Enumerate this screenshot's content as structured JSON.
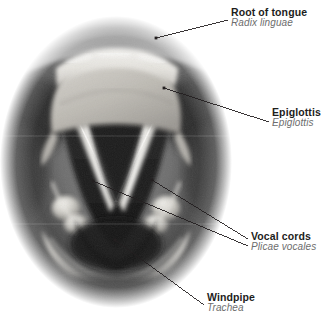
{
  "figure": {
    "image_type": "grayscale anatomical photograph",
    "view": "superior view through laryngoscope",
    "background_color": "#ffffff",
    "label_color": "#1d1d1b",
    "latin_label_color": "#6d6d6d",
    "leader_color": "#231f20"
  },
  "labels": [
    {
      "id": "root-of-tongue",
      "en": "Root of tongue",
      "la": "Radix linguae",
      "label_x": 231,
      "label_y": 7,
      "dot_x": 156,
      "dot_y": 38,
      "elbow_x": 228,
      "elbow_y": 20
    },
    {
      "id": "epiglottis",
      "en": "Epiglottis",
      "la": "Epiglottis",
      "label_x": 272,
      "label_y": 107,
      "dot_x": 164,
      "dot_y": 88,
      "elbow_x": 269,
      "elbow_y": 122
    },
    {
      "id": "vocal-cords",
      "en": "Vocal cords",
      "la": "Plicae vocales",
      "label_x": 251,
      "label_y": 231,
      "dot_x": 93,
      "dot_y": 181,
      "dot2_x": 152,
      "dot2_y": 180,
      "elbow_x": 248,
      "elbow_y": 246,
      "elbow2_x": 248,
      "elbow2_y": 239
    },
    {
      "id": "windpipe",
      "en": "Windpipe",
      "la": "Trachea",
      "label_x": 207,
      "label_y": 292,
      "dot_x": 115,
      "dot_y": 240,
      "elbow_x": 204,
      "elbow_y": 305
    }
  ],
  "anatomy_regions": [
    {
      "id": "epiglottis-body",
      "name": "Epiglottis",
      "tone": "light gray dome"
    },
    {
      "id": "root-of-tongue-area",
      "name": "Root of tongue",
      "tone": "mid gray textured band"
    },
    {
      "id": "vocal-cord-left",
      "name": "Left vocal cord",
      "tone": "bright white band"
    },
    {
      "id": "vocal-cord-right",
      "name": "Right vocal cord",
      "tone": "bright white band"
    },
    {
      "id": "glottis",
      "name": "Glottic opening",
      "tone": "dark triangular aperture"
    },
    {
      "id": "trachea-lumen",
      "name": "Trachea",
      "tone": "deep dark region"
    },
    {
      "id": "arytenoid-left",
      "name": "Left arytenoid cartilage",
      "tone": "highlighted nodule"
    },
    {
      "id": "arytenoid-right",
      "name": "Right arytenoid cartilage",
      "tone": "highlighted nodule"
    },
    {
      "id": "pyriform-sinus-left",
      "name": "Left pyriform recess",
      "tone": "dark lateral recess"
    },
    {
      "id": "pyriform-sinus-right",
      "name": "Right pyriform recess",
      "tone": "dark lateral recess"
    }
  ]
}
